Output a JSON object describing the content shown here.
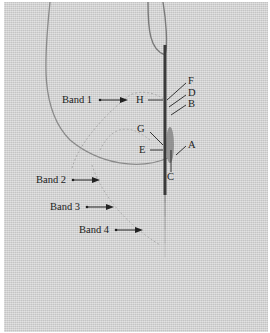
{
  "figure": {
    "bands": [
      {
        "label": "Band 1"
      },
      {
        "label": "Band 2"
      },
      {
        "label": "Band 3"
      },
      {
        "label": "Band 4"
      }
    ],
    "points": {
      "A": "A",
      "B": "B",
      "C": "C",
      "D": "D",
      "E": "E",
      "F": "F",
      "G": "G",
      "H": "H"
    },
    "colors": {
      "fabric": "#d6d6d6",
      "needle": "#3a3a3a",
      "thread": "#8a8a8a",
      "text": "#222222"
    }
  }
}
